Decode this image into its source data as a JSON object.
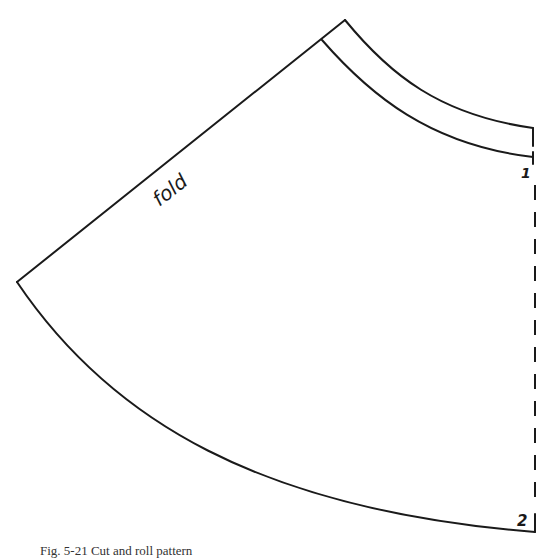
{
  "diagram": {
    "type": "sewing-pattern",
    "labels": {
      "fold": "fold",
      "point_1": "1",
      "point_2": "2"
    },
    "caption": "Fig. 5-21 Cut and roll pattern",
    "line_color": "#1a1a1a",
    "background": "#ffffff",
    "points": {
      "apex_outer": [
        345,
        20
      ],
      "waistband_inner_start": [
        322,
        40
      ],
      "left_point": [
        17,
        282
      ],
      "waist_outer_end": [
        533,
        128
      ],
      "waist_inner_end": [
        533,
        157
      ],
      "hem_end": [
        535,
        532
      ]
    }
  }
}
